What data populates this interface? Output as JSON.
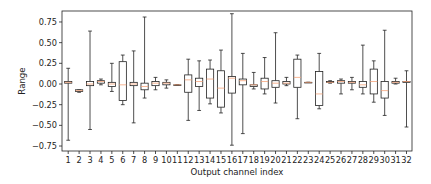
{
  "chart_data": {
    "type": "box",
    "title": "",
    "xlabel": "Output channel index",
    "ylabel": "Range",
    "ylim": [
      -0.8,
      0.9
    ],
    "yticks": [
      0.75,
      0.5,
      0.25,
      0.0,
      -0.25,
      -0.5,
      -0.75
    ],
    "ytick_labels": [
      "0.75",
      "0.50",
      "0.25",
      "0.00",
      "−0.25",
      "−0.50",
      "−0.75"
    ],
    "grid": false,
    "legend": null,
    "categories": [
      "1",
      "2",
      "3",
      "4",
      "5",
      "6",
      "7",
      "8",
      "9",
      "10",
      "11",
      "12",
      "13",
      "14",
      "15",
      "16",
      "17",
      "18",
      "19",
      "20",
      "21",
      "22",
      "23",
      "24",
      "25",
      "26",
      "27",
      "28",
      "29",
      "30",
      "31",
      "32"
    ],
    "boxes": [
      {
        "channel": 1,
        "whislo": -0.68,
        "q1": 0.01,
        "med": 0.02,
        "q3": 0.03,
        "whishi": 0.19
      },
      {
        "channel": 2,
        "whislo": -0.1,
        "q1": -0.09,
        "med": -0.08,
        "q3": -0.07,
        "whishi": -0.07
      },
      {
        "channel": 3,
        "whislo": -0.55,
        "q1": -0.02,
        "med": 0.0,
        "q3": 0.03,
        "whishi": 0.64
      },
      {
        "channel": 4,
        "whislo": -0.01,
        "q1": 0.01,
        "med": 0.03,
        "q3": 0.04,
        "whishi": 0.06
      },
      {
        "channel": 5,
        "whislo": -0.09,
        "q1": -0.03,
        "med": 0.0,
        "q3": 0.02,
        "whishi": 0.25
      },
      {
        "channel": 6,
        "whislo": -0.25,
        "q1": -0.2,
        "med": -0.01,
        "q3": 0.27,
        "whishi": 0.35
      },
      {
        "channel": 7,
        "whislo": -0.47,
        "q1": -0.02,
        "med": 0.0,
        "q3": 0.02,
        "whishi": 0.4
      },
      {
        "channel": 8,
        "whislo": -0.17,
        "q1": -0.07,
        "med": -0.03,
        "q3": 0.01,
        "whishi": 0.81
      },
      {
        "channel": 9,
        "whislo": -0.07,
        "q1": -0.02,
        "med": 0.01,
        "q3": 0.03,
        "whishi": 0.08
      },
      {
        "channel": 10,
        "whislo": -0.05,
        "q1": -0.01,
        "med": 0.01,
        "q3": 0.02,
        "whishi": 0.05
      },
      {
        "channel": 11,
        "whislo": -0.01,
        "q1": -0.01,
        "med": -0.01,
        "q3": -0.01,
        "whishi": -0.01
      },
      {
        "channel": 12,
        "whislo": -0.44,
        "q1": -0.1,
        "med": 0.05,
        "q3": 0.11,
        "whishi": 0.3
      },
      {
        "channel": 13,
        "whislo": -0.32,
        "q1": -0.03,
        "med": 0.03,
        "q3": 0.07,
        "whishi": 0.28
      },
      {
        "channel": 14,
        "whislo": -0.24,
        "q1": -0.17,
        "med": 0.06,
        "q3": 0.18,
        "whishi": 0.29
      },
      {
        "channel": 15,
        "whislo": -0.35,
        "q1": -0.28,
        "med": -0.05,
        "q3": 0.16,
        "whishi": 0.41
      },
      {
        "channel": 16,
        "whislo": -0.74,
        "q1": -0.11,
        "med": 0.07,
        "q3": 0.09,
        "whishi": 0.85
      },
      {
        "channel": 17,
        "whislo": -0.6,
        "q1": -0.01,
        "med": 0.04,
        "q3": 0.06,
        "whishi": 0.37
      },
      {
        "channel": 18,
        "whislo": -0.06,
        "q1": -0.03,
        "med": -0.01,
        "q3": -0.01,
        "whishi": 0.14
      },
      {
        "channel": 19,
        "whislo": -0.12,
        "q1": -0.06,
        "med": 0.03,
        "q3": 0.07,
        "whishi": 0.32
      },
      {
        "channel": 20,
        "whislo": -0.23,
        "q1": -0.04,
        "med": 0.01,
        "q3": 0.04,
        "whishi": 0.62
      },
      {
        "channel": 21,
        "whislo": -0.02,
        "q1": 0.0,
        "med": 0.01,
        "q3": 0.03,
        "whishi": 0.08
      },
      {
        "channel": 22,
        "whislo": -0.42,
        "q1": -0.04,
        "med": 0.08,
        "q3": 0.3,
        "whishi": 0.35
      },
      {
        "channel": 23,
        "whislo": 0.02,
        "q1": 0.02,
        "med": 0.02,
        "q3": 0.02,
        "whishi": 0.02
      },
      {
        "channel": 24,
        "whislo": -0.3,
        "q1": -0.26,
        "med": -0.12,
        "q3": 0.15,
        "whishi": 0.37
      },
      {
        "channel": 25,
        "whislo": 0.01,
        "q1": 0.02,
        "med": 0.02,
        "q3": 0.03,
        "whishi": 0.04
      },
      {
        "channel": 26,
        "whislo": -0.12,
        "q1": 0.01,
        "med": 0.03,
        "q3": 0.04,
        "whishi": 0.06
      },
      {
        "channel": 27,
        "whislo": -0.07,
        "q1": 0.01,
        "med": 0.02,
        "q3": 0.03,
        "whishi": 0.08
      },
      {
        "channel": 28,
        "whislo": -0.12,
        "q1": -0.04,
        "med": -0.01,
        "q3": 0.03,
        "whishi": 0.47
      },
      {
        "channel": 29,
        "whislo": -0.22,
        "q1": -0.12,
        "med": 0.03,
        "q3": 0.18,
        "whishi": 0.28
      },
      {
        "channel": 30,
        "whislo": -0.38,
        "q1": -0.17,
        "med": -0.08,
        "q3": 0.03,
        "whishi": 0.65
      },
      {
        "channel": 31,
        "whislo": 0.0,
        "q1": 0.01,
        "med": 0.02,
        "q3": 0.03,
        "whishi": 0.07
      },
      {
        "channel": 32,
        "whislo": -0.52,
        "q1": 0.02,
        "med": 0.03,
        "q3": 0.03,
        "whishi": 0.16
      }
    ],
    "colors": {
      "box_edge": "#222222",
      "median": "#f5a37a",
      "whisker": "#222222",
      "axes": "#222222",
      "background": "#ffffff"
    }
  }
}
